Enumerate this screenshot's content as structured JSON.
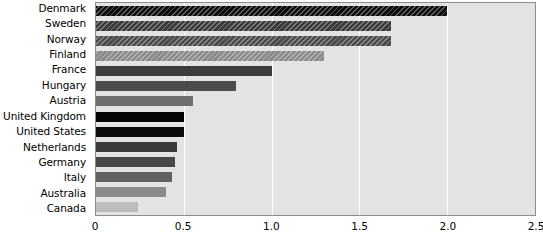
{
  "chart_data": {
    "type": "bar",
    "orientation": "horizontal",
    "title": "",
    "xlabel": "",
    "ylabel": "",
    "xlim": [
      0,
      2.5
    ],
    "xticks": [
      "0",
      "0.5",
      "1.0",
      "1.5",
      "2.0",
      "2.5"
    ],
    "xtick_values": [
      0,
      0.5,
      1.0,
      1.5,
      2.0,
      2.5
    ],
    "grid": "vertical-white-gridlines",
    "legend": "none",
    "plot_background": "#e3e3e3",
    "categories": [
      "Denmark",
      "Sweden",
      "Norway",
      "Finland",
      "France",
      "Hungary",
      "Austria",
      "United Kingdom",
      "United States",
      "Netherlands",
      "Germany",
      "Italy",
      "Australia",
      "Canada"
    ],
    "values": [
      2.0,
      1.68,
      1.68,
      1.3,
      1.0,
      0.8,
      0.55,
      0.5,
      0.5,
      0.46,
      0.45,
      0.43,
      0.4,
      0.24
    ],
    "bar_colors": [
      "#0a0a0a",
      "#3a3a3a",
      "#4a4a4a",
      "#8a8a8a",
      "#3c3c3c",
      "#4b4b4b",
      "#6e6e6e",
      "#050505",
      "#0d0d0d",
      "#3b3b3b",
      "#484848",
      "#616161",
      "#8b8b8b",
      "#bdbdbd"
    ],
    "bar_patterns": [
      "hatched",
      "hatched",
      "hatched",
      "hatched",
      "solid",
      "solid",
      "solid",
      "solid",
      "solid",
      "solid",
      "solid",
      "solid",
      "solid",
      "solid"
    ]
  }
}
